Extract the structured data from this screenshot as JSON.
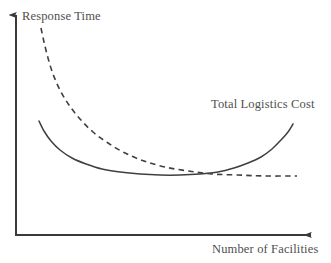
{
  "chart_data": {
    "type": "line",
    "title": "",
    "subtitle": "",
    "xlabel": "Number of Facilities",
    "ylabel": "Response Time",
    "grid": false,
    "legend_position": "inline-annotation",
    "axis_style": "arrow-headed schematic axes, no tick marks, no numeric scale",
    "xlim": [
      0,
      1
    ],
    "ylim": [
      0,
      1
    ],
    "annotations": [
      {
        "text": "Total Logistics Cost",
        "target_series": "Total Logistics Cost",
        "x_px": 211,
        "y_px": 98
      },
      {
        "text": "Response Time",
        "target_series": "Response Time",
        "x_px": 22,
        "y_px": 10
      }
    ],
    "series": [
      {
        "name": "Response Time",
        "style": "dashed",
        "color": "#3f3f3f",
        "shape": "monotonically decreasing convex decay to horizontal asymptote",
        "points_px": [
          [
            41,
            28
          ],
          [
            44,
            42
          ],
          [
            48,
            58
          ],
          [
            53,
            74
          ],
          [
            60,
            90
          ],
          [
            69,
            105
          ],
          [
            80,
            119
          ],
          [
            93,
            132
          ],
          [
            108,
            143
          ],
          [
            125,
            153
          ],
          [
            144,
            161
          ],
          [
            165,
            167
          ],
          [
            188,
            171
          ],
          [
            212,
            174
          ],
          [
            238,
            175
          ],
          [
            265,
            176
          ],
          [
            297,
            176
          ]
        ]
      },
      {
        "name": "Total Logistics Cost",
        "style": "solid",
        "color": "#3f3f3f",
        "shape": "U-shaped convex curve with interior minimum",
        "points_px": [
          [
            39,
            121
          ],
          [
            44,
            131
          ],
          [
            51,
            141
          ],
          [
            60,
            150
          ],
          [
            72,
            158
          ],
          [
            86,
            164
          ],
          [
            102,
            169
          ],
          [
            120,
            172
          ],
          [
            140,
            174
          ],
          [
            160,
            175
          ],
          [
            180,
            175
          ],
          [
            200,
            174
          ],
          [
            218,
            172
          ],
          [
            234,
            168
          ],
          [
            248,
            163
          ],
          [
            261,
            157
          ],
          [
            272,
            149
          ],
          [
            281,
            140
          ],
          [
            288,
            132
          ],
          [
            293,
            124
          ]
        ]
      }
    ]
  },
  "axes": {
    "color": "#3a3a3a",
    "origin_px": [
      16,
      235
    ],
    "y_tip_px": [
      16,
      10
    ],
    "x_tip_px": [
      317,
      235
    ],
    "stroke_width": 2
  },
  "labels": {
    "y_axis": "Response Time",
    "x_axis": "Number of Facilities",
    "cost_series": "Total Logistics Cost"
  },
  "colors": {
    "background": "#ffffff",
    "axis": "#3a3a3a",
    "curve": "#3f3f3f",
    "text": "#4f4f4f"
  }
}
